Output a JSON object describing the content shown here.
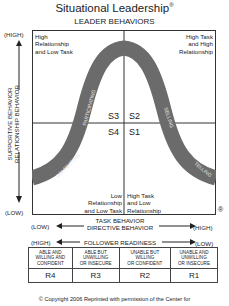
{
  "title": "Situational Leadership",
  "title_mark": "®",
  "subtitle": "LEADER BEHAVIORS",
  "quadrants": {
    "top_left": [
      "High",
      "Relationship",
      "and Low Task"
    ],
    "top_right": [
      "High Task",
      "and High",
      "Relationship"
    ],
    "bottom_left": [
      "Low",
      "Relationship",
      "and Low Task"
    ],
    "bottom_right": [
      "High Task",
      "and Low",
      "Relationship"
    ]
  },
  "styles": [
    "S3",
    "S2",
    "S4",
    "S1"
  ],
  "curve_labels": [
    "DELEGATING",
    "PARTICIPATING",
    "SELLING",
    "TELLING"
  ],
  "y_axis": {
    "high": "(HIGH)",
    "low": "(LOW)",
    "label1": "SUPPORTIVE BEHAVIOR",
    "label2": "RELATIONSHIP BEHAVIOR"
  },
  "x_axis": {
    "low": "(LOW)",
    "high": "(HIGH)",
    "label1": "TASK BEHAVIOR",
    "label2": "DIRECTIVE BEHAVIOR"
  },
  "registered_mark": "®",
  "readiness": {
    "high": "(HIGH)",
    "low": "(LOW)",
    "label": "FOLLOWER READINESS",
    "columns": [
      {
        "desc": [
          "ABLE AND",
          "WILLING AND",
          "CONFIDENT"
        ],
        "code": "R4"
      },
      {
        "desc": [
          "ABLE BUT",
          "UNWILLING",
          "OR INSECURE"
        ],
        "code": "R3"
      },
      {
        "desc": [
          "UNABLE BUT",
          "WILLING",
          "OR CONFIDENT"
        ],
        "code": "R2"
      },
      {
        "desc": [
          "UNABLE AND",
          "UNWILLING",
          "OR INSECURE"
        ],
        "code": "R1"
      }
    ]
  },
  "copyright": "© Copyright 2006 Reprinted with permission of the Center for",
  "colors": {
    "curve": "#6b6b6b",
    "curve_text": "#e8e8e8",
    "line": "#333333"
  }
}
